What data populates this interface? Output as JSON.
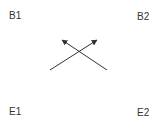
{
  "labels": {
    "top_left": "B1",
    "top_right": "B2",
    "bottom_left": "E1",
    "bottom_right": "E2"
  },
  "arrows": [
    {
      "name": "arrow-up-right",
      "from": [
        50,
        70
      ],
      "to": [
        97,
        40
      ]
    },
    {
      "name": "arrow-up-left",
      "from": [
        107,
        70
      ],
      "to": [
        62,
        40
      ]
    }
  ],
  "colors": {
    "arrow": "#333333",
    "text": "#333333",
    "background": "#ffffff"
  }
}
